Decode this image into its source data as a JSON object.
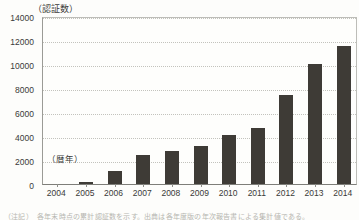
{
  "chart_data": {
    "type": "bar",
    "title": "",
    "subtitle": "",
    "xlabel": "（暦年）",
    "ylabel": "（認証数）",
    "categories": [
      "2004",
      "2005",
      "2006",
      "2007",
      "2008",
      "2009",
      "2010",
      "2011",
      "2012",
      "2013",
      "2014"
    ],
    "values": [
      0,
      200,
      1100,
      2400,
      2750,
      3200,
      4050,
      4700,
      7400,
      10000,
      11500
    ],
    "series": [
      {
        "name": "認証数",
        "values": [
          0,
          200,
          1100,
          2400,
          2750,
          3200,
          4050,
          4700,
          7400,
          10000,
          11500
        ]
      }
    ],
    "ylim": [
      0,
      14000
    ],
    "y_ticks": [
      "0",
      "2000",
      "4000",
      "6000",
      "8000",
      "10000",
      "12000",
      "14000"
    ],
    "y_tick_values": [
      0,
      2000,
      4000,
      6000,
      8000,
      10000,
      12000,
      14000
    ],
    "grid": true,
    "grid_axis": "y",
    "legend": false,
    "legend_position": "none",
    "bar_color": "#3e3b36",
    "grid_color": "#c3c3bd",
    "axis_color": "#8d8d88",
    "text_color": "#3a3a38",
    "background": "#fefefc"
  },
  "footer": {
    "caption": "（注記）　各年末時点の累計認証数を示す。出典は各年度版の年次報告書による集計値である。"
  }
}
